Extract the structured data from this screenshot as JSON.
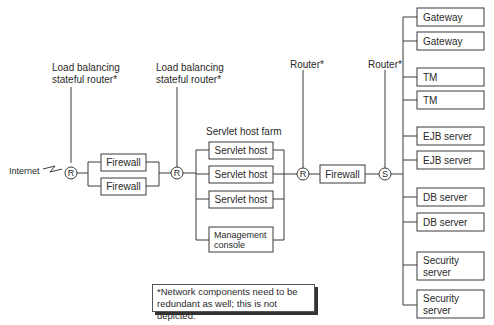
{
  "diagram": {
    "type": "network-architecture",
    "nodes": {
      "internet": {
        "label": "Internet"
      },
      "lb_router_1": {
        "label_line1": "Load balancing",
        "label_line2": "stateful router*",
        "glyph": "R"
      },
      "firewall_1a": {
        "label": "Firewall"
      },
      "firewall_1b": {
        "label": "Firewall"
      },
      "lb_router_2": {
        "label_line1": "Load balancing",
        "label_line2": "stateful router*",
        "glyph": "R"
      },
      "servlet_farm": {
        "title": "Servlet host farm",
        "members": [
          {
            "label": "Servlet host"
          },
          {
            "label": "Servlet host"
          },
          {
            "label": "Servlet host"
          },
          {
            "label_line1": "Management",
            "label_line2": "console"
          }
        ]
      },
      "router_3": {
        "label": "Router*",
        "glyph": "R"
      },
      "firewall_2": {
        "label": "Firewall"
      },
      "switch": {
        "label": "Router*",
        "glyph": "S"
      },
      "backend": [
        {
          "label": "Gateway"
        },
        {
          "label": "Gateway"
        },
        {
          "label": "TM"
        },
        {
          "label": "TM"
        },
        {
          "label": "EJB server"
        },
        {
          "label": "EJB server"
        },
        {
          "label": "DB server"
        },
        {
          "label": "DB server"
        },
        {
          "label_line1": "Security",
          "label_line2": "server"
        },
        {
          "label_line1": "Security",
          "label_line2": "server"
        }
      ]
    },
    "note": {
      "line1": "*Network components need to be",
      "line2": "redundant as well; this is not depicted."
    }
  }
}
